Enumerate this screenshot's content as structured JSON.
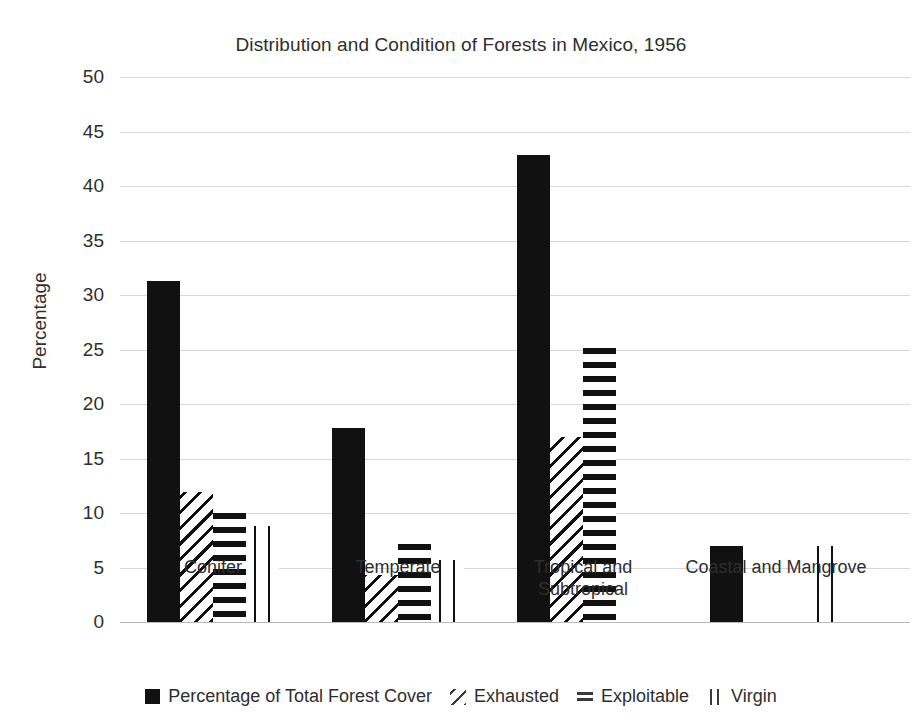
{
  "chart_data": {
    "type": "bar",
    "title": "Distribution and Condition of Forests in Mexico, 1956",
    "xlabel": "",
    "ylabel": "Percentage",
    "ylim": [
      0,
      50
    ],
    "yticks": [
      0,
      5,
      10,
      15,
      20,
      25,
      30,
      35,
      40,
      45,
      50
    ],
    "grid": true,
    "legend_position": "bottom",
    "categories": [
      "Conifer",
      "Temperate",
      "Tropical and Subtropical",
      "Coastal and Mangrove"
    ],
    "series": [
      {
        "name": "Percentage of Total Forest Cover",
        "pattern": "solid",
        "values": [
          31.3,
          17.8,
          42.8,
          7.0
        ]
      },
      {
        "name": "Exhausted",
        "pattern": "diagonal-hatch",
        "values": [
          11.9,
          4.3,
          17.0,
          0
        ]
      },
      {
        "name": "Exploitable",
        "pattern": "horizontal-stripes",
        "values": [
          10.0,
          7.2,
          25.1,
          0
        ]
      },
      {
        "name": "Virgin",
        "pattern": "vertical-lines",
        "values": [
          8.8,
          5.7,
          0,
          7.0
        ]
      }
    ]
  },
  "axis": {
    "y_label": "Percentage",
    "tick_labels": [
      "50",
      "45",
      "40",
      "35",
      "30",
      "25",
      "20",
      "15",
      "10",
      "5",
      "0"
    ]
  },
  "category_labels": [
    {
      "line1": "Conifer",
      "line2": ""
    },
    {
      "line1": "Temperate",
      "line2": ""
    },
    {
      "line1": "Tropical and",
      "line2": "Subtropical"
    },
    {
      "line1": "Coastal and Mangrove",
      "line2": ""
    }
  ],
  "legend": {
    "entries": [
      {
        "label": "Percentage of Total Forest Cover",
        "swatch": "solid-square-icon"
      },
      {
        "label": "Exhausted",
        "swatch": "diagonal-hatch-icon"
      },
      {
        "label": "Exploitable",
        "swatch": "horizontal-stripes-icon"
      },
      {
        "label": "Virgin",
        "swatch": "vertical-lines-icon"
      }
    ]
  },
  "colors": {
    "bar": "#111111",
    "grid": "#d6d6d6",
    "text": "#2e2e2e",
    "background": "#ffffff"
  }
}
